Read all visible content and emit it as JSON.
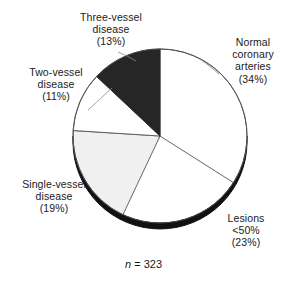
{
  "figure": {
    "caption_italic": "n",
    "caption_rest": " = 323"
  },
  "labels": {
    "three_vessel": {
      "line1": "Three-vessel",
      "line2": "disease",
      "line3": "(13%)"
    },
    "normal": {
      "line1": "Normal",
      "line2": "coronary",
      "line3": "arteries",
      "line4": "(34%)"
    },
    "two_vessel": {
      "line1": "Two-vessel",
      "line2": "disease",
      "line3": "(11%)"
    },
    "single_vessel": {
      "line1": "Single-vessel",
      "line2": "disease",
      "line3": "(19%)"
    },
    "lesions": {
      "line1": "Lesions",
      "line2": "<50%",
      "line3": "(23%)"
    }
  },
  "chart_data": {
    "type": "pie",
    "title": "",
    "subtitle": "",
    "xlabel": "",
    "ylabel": "",
    "annotation": "n = 323",
    "total_n": 323,
    "units": "percent",
    "start_angle_deg": 0,
    "direction": "clockwise",
    "legend_position": "outside-radial-labels",
    "grid": false,
    "categories": [
      "Normal coronary arteries",
      "Lesions <50%",
      "Single-vessel disease",
      "Two-vessel disease",
      "Three-vessel disease"
    ],
    "values": [
      34,
      23,
      19,
      11,
      13
    ],
    "value_labels": [
      "(34%)",
      "(23%)",
      "(19%)",
      "(11%)",
      "(13%)"
    ],
    "slice_colors": [
      "#ffffff",
      "#f0f0f0",
      "#f0f0f0",
      "#ffffff",
      "#262626"
    ],
    "slice_edge_color": "#555555",
    "rim_color": "#111111",
    "background": "#ffffff"
  }
}
